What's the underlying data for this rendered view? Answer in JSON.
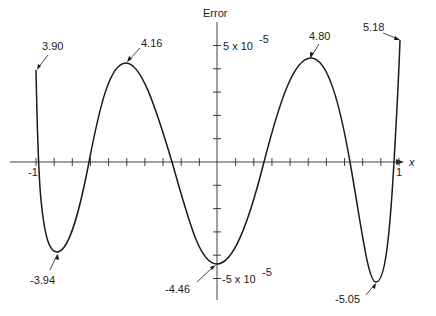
{
  "chart_data": {
    "type": "line",
    "title": "",
    "xlabel": "x",
    "ylabel": "Error",
    "xlim": [
      -1,
      1
    ],
    "ylim": [
      -6e-05,
      6e-05
    ],
    "grid": false,
    "legend": null,
    "x_tick_labels": [
      "-1",
      "1"
    ],
    "y_tick_labels": [
      "5 x 10^-5",
      "-5 x 10^-5"
    ],
    "y_tick_step": 1e-05,
    "x_tick_step": 0.1,
    "series": [
      {
        "name": "Error",
        "x": [
          -1.0,
          -0.884,
          -0.7,
          -0.504,
          -0.25,
          0.0,
          0.26,
          0.515,
          0.73,
          0.873,
          0.97,
          1.0
        ],
        "values": [
          3.9e-05,
          -3.94e-05,
          0.0,
          4.16e-05,
          0.0,
          -4.46e-05,
          0.0,
          4.8e-05,
          0.0,
          -5.05e-05,
          0.0,
          5.18e-05
        ]
      }
    ],
    "annotations": [
      {
        "text": "3.90",
        "x": -1.0,
        "y": 3.9e-05
      },
      {
        "text": "4.16",
        "x": -0.504,
        "y": 4.16e-05
      },
      {
        "text": "-3.94",
        "x": -0.884,
        "y": -3.94e-05
      },
      {
        "text": "-4.46",
        "x": 0.0,
        "y": -4.46e-05
      },
      {
        "text": "4.80",
        "x": 0.515,
        "y": 4.8e-05
      },
      {
        "text": "-5.05",
        "x": 0.873,
        "y": -5.05e-05
      },
      {
        "text": "5.18",
        "x": 1.0,
        "y": 5.18e-05
      }
    ]
  },
  "labels": {
    "y_axis_title": "Error",
    "x_axis_title": "x",
    "x_min": "-1",
    "x_max": "1",
    "y_pos_mantissa": "5 x 10",
    "y_pos_exp": "-5",
    "y_neg_mantissa": "-5 x 10",
    "y_neg_exp": "-5",
    "ann_390": "3.90",
    "ann_416": "4.16",
    "ann_394": "-3.94",
    "ann_446": "-4.46",
    "ann_480": "4.80",
    "ann_505": "-5.05",
    "ann_518": "5.18"
  }
}
